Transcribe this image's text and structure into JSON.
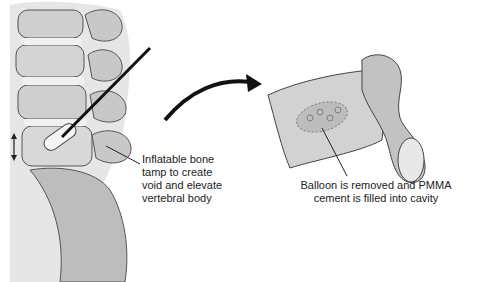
{
  "diagram": {
    "left_panel": {
      "label_lines": [
        "Inflatable bone",
        "tamp to create",
        "void and elevate",
        "vertebral body"
      ]
    },
    "right_panel": {
      "label_lines": [
        "Balloon is removed and PMMA",
        "cement is filled into cavity"
      ]
    },
    "icons": [
      "double-arrow-icon",
      "curved-arrow-icon"
    ]
  }
}
